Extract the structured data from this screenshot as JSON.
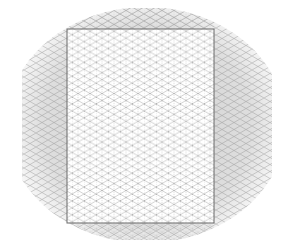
{
  "canvas": {
    "background": "#ffffff",
    "surround_color": "#d8d8d8",
    "grid_type": "isometric",
    "grid_color": "#9a9a9a",
    "hatch_color": "#8c8c8c",
    "page_border_color": "#6a6a6a"
  },
  "page": {
    "x": 67,
    "y": 29,
    "width": 147,
    "height": 194,
    "fill": "#ffffff"
  }
}
